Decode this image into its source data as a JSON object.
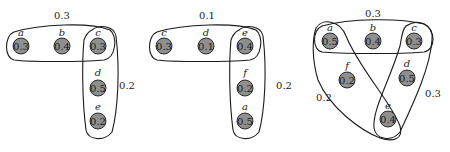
{
  "diagrams": [
    {
      "nodes": [
        {
          "id": "a",
          "value": "0.3",
          "x": 21,
          "y": 46
        },
        {
          "id": "b",
          "value": "0.4",
          "x": 62,
          "y": 46
        },
        {
          "id": "c",
          "value": "0.3",
          "x": 98,
          "y": 46
        },
        {
          "id": "d",
          "value": "0.5",
          "x": 98,
          "y": 88
        },
        {
          "id": "e",
          "value": "0.2",
          "x": 98,
          "y": 121
        }
      ],
      "hyperedges": [
        {
          "members": [
            "a",
            "b",
            "c"
          ],
          "weight": "0.3",
          "label_x": 62,
          "label_y": 19
        },
        {
          "members": [
            "c",
            "d",
            "e"
          ],
          "weight": "0.2",
          "label_x": 127,
          "label_y": 89
        }
      ]
    },
    {
      "nodes": [
        {
          "id": "c",
          "value": "0.3",
          "x": 164,
          "y": 46
        },
        {
          "id": "d",
          "value": "0.1",
          "x": 206,
          "y": 46
        },
        {
          "id": "e",
          "value": "0.4",
          "x": 245,
          "y": 46
        },
        {
          "id": "f",
          "value": "0.2",
          "x": 245,
          "y": 88
        },
        {
          "id": "a",
          "value": "0.5",
          "x": 245,
          "y": 121
        }
      ],
      "hyperedges": [
        {
          "members": [
            "c",
            "d",
            "e"
          ],
          "weight": "0.1",
          "label_x": 207,
          "label_y": 19
        },
        {
          "members": [
            "e",
            "f",
            "a"
          ],
          "weight": "0.2",
          "label_x": 284,
          "label_y": 89
        }
      ]
    },
    {
      "nodes": [
        {
          "id": "a",
          "value": "0.5",
          "x": 330,
          "y": 41
        },
        {
          "id": "b",
          "value": "0.4",
          "x": 373,
          "y": 41
        },
        {
          "id": "c",
          "value": "0.3",
          "x": 414,
          "y": 41
        },
        {
          "id": "f",
          "value": "0.2",
          "x": 347,
          "y": 80
        },
        {
          "id": "d",
          "value": "0.5",
          "x": 407,
          "y": 78
        },
        {
          "id": "e",
          "value": "0.4",
          "x": 388,
          "y": 119
        }
      ],
      "hyperedges": [
        {
          "members": [
            "a",
            "b",
            "c"
          ],
          "weight": "0.3",
          "label_x": 373,
          "label_y": 17
        },
        {
          "members": [
            "a",
            "e"
          ],
          "weight": "0.2",
          "label_x": 324,
          "label_y": 101
        },
        {
          "members": [
            "c",
            "e"
          ],
          "weight": "0.3",
          "label_x": 433,
          "label_y": 97
        }
      ]
    }
  ],
  "caption": ""
}
